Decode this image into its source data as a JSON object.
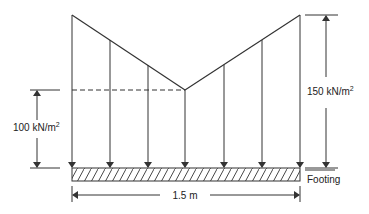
{
  "diagram": {
    "type": "soil pressure distribution under footing",
    "labels": {
      "left_pressure_value": "100 kN/m",
      "left_pressure_exp": "2",
      "right_pressure_value": "150 kN/m",
      "right_pressure_exp": "2",
      "width": "1.5 m",
      "footing": "Footing"
    },
    "pressure_profile": {
      "edge_pressure_kN_m2": 150,
      "center_pressure_kN_m2": 100,
      "shape": "V (maximum at edges, minimum at center)"
    },
    "footing_width_m": 1.5,
    "arrow_count": 7,
    "colors": {
      "line": "#333333",
      "background": "#ffffff"
    }
  }
}
